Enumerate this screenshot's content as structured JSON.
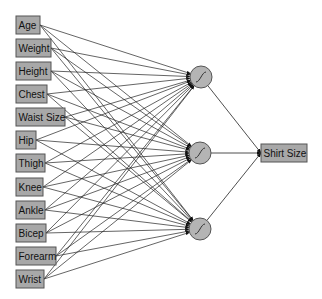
{
  "diagram": {
    "type": "neural-network",
    "colors": {
      "box_fill": "#a8a8a8",
      "box_stroke": "#555555",
      "node_fill": "#b4b4b4",
      "node_stroke": "#555555",
      "edge": "#222222",
      "background": "#ffffff"
    },
    "inputs": [
      {
        "label": "Age",
        "x": 16,
        "y": 16,
        "w": 24
      },
      {
        "label": "Weight",
        "x": 16,
        "y": 39,
        "w": 35
      },
      {
        "label": "Height",
        "x": 16,
        "y": 62,
        "w": 35
      },
      {
        "label": "Chest",
        "x": 16,
        "y": 85,
        "w": 31
      },
      {
        "label": "Waist Size",
        "x": 16,
        "y": 108,
        "w": 49
      },
      {
        "label": "Hip",
        "x": 16,
        "y": 131,
        "w": 20
      },
      {
        "label": "Thigh",
        "x": 16,
        "y": 154,
        "w": 29
      },
      {
        "label": "Knee",
        "x": 16,
        "y": 178,
        "w": 27
      },
      {
        "label": "Ankle",
        "x": 16,
        "y": 201,
        "w": 29
      },
      {
        "label": "Bicep",
        "x": 16,
        "y": 224,
        "w": 30
      },
      {
        "label": "Forearm",
        "x": 16,
        "y": 247,
        "w": 40
      },
      {
        "label": "Wrist",
        "x": 16,
        "y": 270,
        "w": 28
      }
    ],
    "hidden": [
      {
        "id": "h1",
        "cx": 201,
        "cy": 77,
        "r": 11,
        "activation": "sigmoid"
      },
      {
        "id": "h2",
        "cx": 200,
        "cy": 153,
        "r": 11,
        "activation": "sigmoid"
      },
      {
        "id": "h3",
        "cx": 200,
        "cy": 229,
        "r": 11,
        "activation": "sigmoid"
      }
    ],
    "output": {
      "label": "Shirt Size",
      "x": 261,
      "y": 144,
      "w": 46,
      "h": 18
    }
  }
}
